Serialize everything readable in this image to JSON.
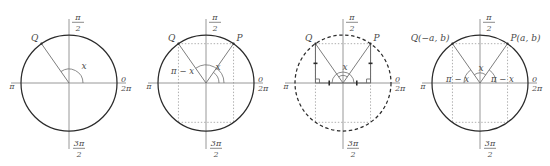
{
  "figure": {
    "panel_count": 4,
    "colors": {
      "circle_stroke": "#2b2b2b",
      "axis_stroke": "#8c8c8c",
      "radius_stroke": "#6e6e6e",
      "dotted_stroke": "#9a9a9a",
      "text": "#4a4a4a",
      "background": "#ffffff"
    },
    "common_axis_labels": {
      "top_numerator": "π",
      "top_denominator": "2",
      "bottom_numerator": "3π",
      "bottom_denominator": "2",
      "left": "π",
      "right_top": "0",
      "right_bottom": "2π"
    },
    "panels": [
      {
        "id": "panel-1",
        "name": "single-radius-angle-x",
        "circle_style": "solid",
        "points": [
          {
            "label": "Q",
            "name": "point-q",
            "angle_deg": 125
          }
        ],
        "angle_labels": [
          {
            "text": "x",
            "name": "angle-label-x"
          }
        ],
        "has_dotted_rectangle": false,
        "has_right_angle_marks": false,
        "has_tick_marks": false
      },
      {
        "id": "panel-2",
        "name": "rectangle-with-angles-x-and-pi-minus-x",
        "circle_style": "solid",
        "points": [
          {
            "label": "Q",
            "name": "point-q",
            "angle_deg": 125
          },
          {
            "label": "P",
            "name": "point-p",
            "angle_deg": 55
          }
        ],
        "angle_labels": [
          {
            "text": "π − x",
            "name": "angle-label-pi-minus-x"
          },
          {
            "text": "x",
            "name": "angle-label-x"
          }
        ],
        "has_dotted_rectangle": true,
        "has_right_angle_marks": false,
        "has_tick_marks": false
      },
      {
        "id": "panel-3",
        "name": "congruent-right-triangles",
        "circle_style": "dashed",
        "points": [
          {
            "label": "Q",
            "name": "point-q",
            "angle_deg": 125
          },
          {
            "label": "P",
            "name": "point-p",
            "angle_deg": 55
          }
        ],
        "angle_labels": [
          {
            "text": "x",
            "name": "angle-label-x"
          }
        ],
        "has_dotted_rectangle": true,
        "has_right_angle_marks": true,
        "has_tick_marks": true
      },
      {
        "id": "panel-4",
        "name": "coordinates-p-a-b-and-q-minus-a-b",
        "circle_style": "solid",
        "points": [
          {
            "label": "Q(−a, b)",
            "name": "point-q-coordinates",
            "angle_deg": 125
          },
          {
            "label": "P(a, b)",
            "name": "point-p-coordinates",
            "angle_deg": 55
          }
        ],
        "angle_labels": [
          {
            "text": "π − x",
            "name": "angle-label-pi-minus-x-left"
          },
          {
            "text": "x",
            "name": "angle-label-x"
          },
          {
            "text": "π − x",
            "name": "angle-label-pi-minus-x-right"
          }
        ],
        "has_dotted_rectangle": true,
        "has_right_angle_marks": false,
        "has_tick_marks": false
      }
    ]
  }
}
